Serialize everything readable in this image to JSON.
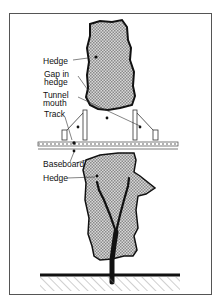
{
  "diagram": {
    "labels": {
      "hedge_top": "Hedge",
      "gap_line1": "Gap in",
      "gap_line2": "hedge",
      "tunnel_line1": "Tunnel",
      "tunnel_line2": "mouth",
      "track": "Track",
      "baseboard": "Baseboard",
      "hedge_bottom": "Hedge"
    },
    "colors": {
      "outline": "#111111",
      "frame": "#555555",
      "hedge_fill": "#b8b8b8",
      "hatch": "#777777"
    }
  }
}
